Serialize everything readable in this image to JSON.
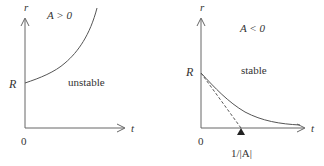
{
  "left_panel": {
    "y_axis_label": "r",
    "x_axis_label": "t",
    "condition": "A > 0",
    "intercept_label": "R",
    "origin_label": "0",
    "region_label": "unstable"
  },
  "right_panel": {
    "y_axis_label": "r",
    "x_axis_label": "t",
    "condition": "A < 0",
    "intercept_label": "R",
    "origin_label": "0",
    "region_label": "stable",
    "marker_label": "1/|A|"
  },
  "colors": {
    "line": "#555555",
    "text": "#333333"
  }
}
